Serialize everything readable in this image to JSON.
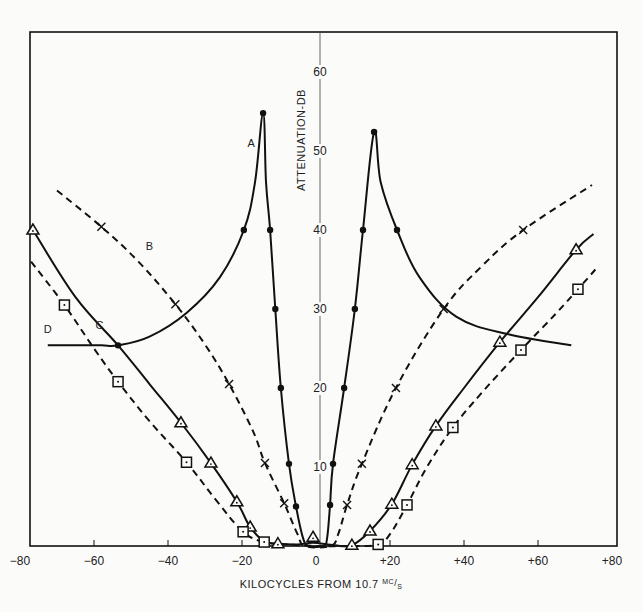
{
  "chart_data": {
    "type": "line",
    "title": "",
    "xlabel": "KILOCYCLES FROM 10.7 MC/S",
    "xlabel_main": "KILOCYCLES FROM 10.7 ",
    "xlabel_sup": "MC",
    "xlabel_sub": "S",
    "ylabel": "ATTENUATION-DB",
    "xlim": [
      -80,
      80
    ],
    "ylim": [
      0,
      65
    ],
    "grid": false,
    "legend": "inline curve labels A, B, C, D",
    "x_ticks": [
      -80,
      -60,
      -40,
      -20,
      0,
      20,
      40,
      60,
      80
    ],
    "x_tick_labels": [
      "−80",
      "−60",
      "−40",
      "−20",
      "0",
      "+20",
      "+40",
      "+60",
      "+80"
    ],
    "y_ticks": [
      10,
      20,
      30,
      40,
      50,
      60
    ],
    "y_tick_labels": [
      "10",
      "20",
      "30",
      "40",
      "50",
      "60"
    ],
    "series": [
      {
        "name": "A",
        "marker": "dot",
        "line": "solid",
        "label_pos": [
          -17.5,
          50.5
        ],
        "segments": [
          [
            [
              -72.5,
              25.4
            ],
            [
              -65,
              25.4
            ],
            [
              -58,
              25.4
            ],
            [
              -53.5,
              25.4
            ],
            [
              -45,
              26.5
            ],
            [
              -35,
              29.5
            ],
            [
              -26,
              34
            ],
            [
              -19.5,
              40
            ],
            [
              -16.5,
              46
            ],
            [
              -14.3,
              54.8
            ],
            [
              -13.5,
              46
            ],
            [
              -12.4,
              40
            ],
            [
              -11,
              30
            ],
            [
              -9.5,
              20
            ],
            [
              -7.3,
              10.4
            ],
            [
              -5.4,
              5
            ],
            [
              -3.5,
              1
            ],
            [
              -2,
              0
            ],
            [
              2,
              0
            ],
            [
              3,
              1
            ],
            [
              3.8,
              5.2
            ],
            [
              4.6,
              10.4
            ],
            [
              7.6,
              20
            ],
            [
              10.5,
              30
            ],
            [
              12.7,
              40
            ],
            [
              15.7,
              52.4
            ],
            [
              17.5,
              46
            ],
            [
              21.9,
              40
            ],
            [
              28,
              34
            ],
            [
              38,
              29
            ],
            [
              52,
              26.8
            ],
            [
              69,
              25.4
            ]
          ]
        ],
        "points": [
          [
            -53.5,
            25.4
          ],
          [
            -19.5,
            40
          ],
          [
            -14.3,
            54.8
          ],
          [
            -12.4,
            40
          ],
          [
            -11,
            30
          ],
          [
            -9.5,
            20
          ],
          [
            -7.3,
            10.4
          ],
          [
            -5.4,
            5
          ],
          [
            3.8,
            5.2
          ],
          [
            4.6,
            10.4
          ],
          [
            7.6,
            20
          ],
          [
            10.5,
            30
          ],
          [
            12.7,
            40
          ],
          [
            15.7,
            52.4
          ],
          [
            21.9,
            40
          ]
        ]
      },
      {
        "name": "B",
        "marker": "x",
        "line": "dashed",
        "label_pos": [
          -45,
          37.5
        ],
        "segments": [
          [
            [
              -70,
              45
            ],
            [
              -58,
              40.4
            ],
            [
              -48,
              36
            ],
            [
              -38,
              30.6
            ],
            [
              -30,
              25.5
            ],
            [
              -23.5,
              20.5
            ],
            [
              -17,
              14.5
            ],
            [
              -13.8,
              10.5
            ],
            [
              -8.6,
              5.4
            ],
            [
              -5,
              1.5
            ],
            [
              -3,
              0
            ],
            [
              4,
              0
            ],
            [
              6,
              1.5
            ],
            [
              8.4,
              5.2
            ],
            [
              12.4,
              10.4
            ],
            [
              21.6,
              20
            ],
            [
              34.5,
              30
            ],
            [
              45,
              35.5
            ],
            [
              56,
              40
            ],
            [
              74.6,
              45.7
            ]
          ]
        ],
        "points": [
          [
            -58,
            40.4
          ],
          [
            -38,
            30.6
          ],
          [
            -23.5,
            20.5
          ],
          [
            -13.8,
            10.5
          ],
          [
            -8.6,
            5.4
          ],
          [
            8.4,
            5.2
          ],
          [
            12.4,
            10.4
          ],
          [
            21.6,
            20
          ],
          [
            34.5,
            30
          ],
          [
            56,
            40
          ]
        ]
      },
      {
        "name": "C",
        "marker": "triangle",
        "line": "solid",
        "label_pos": [
          -58.5,
          27.5
        ],
        "segments": [
          [
            [
              -76.5,
              40
            ],
            [
              -65,
              31.5
            ],
            [
              -53.5,
              25.4
            ],
            [
              -45,
              20.5
            ],
            [
              -36.5,
              15.6
            ],
            [
              -28.4,
              10.5
            ],
            [
              -21.4,
              5.6
            ],
            [
              -17.8,
              2.4
            ],
            [
              -14,
              0.6
            ],
            [
              -10.3,
              0.3
            ],
            [
              -5,
              0.2
            ],
            [
              -0.8,
              0.4
            ],
            [
              5,
              0.1
            ],
            [
              9.7,
              0.1
            ],
            [
              14.6,
              1.9
            ],
            [
              20.5,
              5.3
            ],
            [
              26,
              10.3
            ],
            [
              32.4,
              15.2
            ],
            [
              40,
              20
            ],
            [
              49.7,
              25.8
            ],
            [
              60,
              31.5
            ],
            [
              70.3,
              37.5
            ],
            [
              75,
              39.5
            ]
          ]
        ],
        "points": [
          [
            -76.5,
            40
          ],
          [
            -36.5,
            15.6
          ],
          [
            -28.4,
            10.5
          ],
          [
            -21.4,
            5.6
          ],
          [
            -17.8,
            2.4
          ],
          [
            -10.3,
            0.3
          ],
          [
            -0.8,
            1.1
          ],
          [
            9.7,
            0.1
          ],
          [
            14.6,
            1.9
          ],
          [
            20.5,
            5.3
          ],
          [
            26,
            10.3
          ],
          [
            32.4,
            15.2
          ],
          [
            49.7,
            25.8
          ],
          [
            70.3,
            37.5
          ]
        ]
      },
      {
        "name": "D",
        "marker": "square",
        "line": "dashed",
        "label_pos": [
          -72.5,
          27.0
        ],
        "segments": [
          [
            [
              -77,
              36
            ],
            [
              -68,
              30.5
            ],
            [
              -60,
              25
            ],
            [
              -53.5,
              20.8
            ],
            [
              -45,
              15.8
            ],
            [
              -35,
              10.6
            ],
            [
              -27,
              5.8
            ],
            [
              -19.7,
              1.8
            ],
            [
              -14,
              0.5
            ],
            [
              -8,
              0.2
            ],
            [
              0,
              0
            ],
            [
              10,
              0
            ],
            [
              16.8,
              0.2
            ],
            [
              20,
              1.5
            ],
            [
              24.6,
              5.2
            ],
            [
              30,
              10
            ],
            [
              37,
              15
            ],
            [
              45,
              19.5
            ],
            [
              55.4,
              24.8
            ],
            [
              65,
              29.5
            ],
            [
              70.8,
              32.5
            ],
            [
              75.5,
              35
            ]
          ]
        ],
        "points": [
          [
            -68,
            30.5
          ],
          [
            -53.5,
            20.8
          ],
          [
            -35,
            10.6
          ],
          [
            -19.7,
            1.8
          ],
          [
            -14,
            0.5
          ],
          [
            16.8,
            0.2
          ],
          [
            24.6,
            5.2
          ],
          [
            37,
            15
          ],
          [
            55.4,
            24.8
          ],
          [
            70.8,
            32.5
          ]
        ]
      }
    ]
  }
}
